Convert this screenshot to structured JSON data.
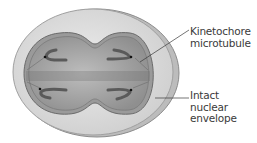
{
  "diagram": {
    "type": "cell-division-illustration",
    "labels": [
      {
        "id": "kinetochore-microtubule",
        "lines": [
          "Kinetochore",
          "microtubule"
        ]
      },
      {
        "id": "intact-nuclear-envelope",
        "lines": [
          "Intact nuclear",
          "envelope"
        ]
      }
    ],
    "colors": {
      "cell_fill": "#dcdcdc",
      "cell_edge": "#9a9a9a",
      "nucleus_fill": "#a9a9a9",
      "nucleus_edge": "#6e6e6e",
      "chromosome": "#5a5a5a",
      "leader_line": "#3a3a3a",
      "text": "#3a3a3a"
    }
  }
}
